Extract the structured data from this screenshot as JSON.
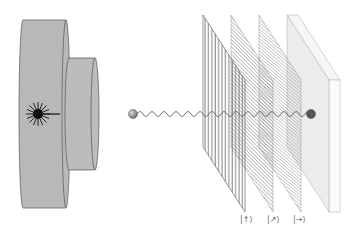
{
  "diagram": {
    "components": {
      "source": {
        "label": "laser-source",
        "body_color": "#b8b8b8",
        "edge_color": "#555555"
      },
      "photon": {
        "color": "#8a8a8a",
        "detected_color": "#555555"
      },
      "polarizers": [
        {
          "orientation": "vertical",
          "state_label": "|↑⟩"
        },
        {
          "orientation": "diagonal",
          "state_label": "|↗⟩"
        },
        {
          "orientation": "diagonal",
          "state_label": "|→⟩"
        }
      ],
      "screen": {
        "color": "#eeeeee",
        "edge_color": "#bbbbbb"
      }
    },
    "labels": {
      "ket_up": "|↑⟩",
      "ket_diag": "|↗⟩",
      "ket_right": "|→⟩"
    }
  }
}
